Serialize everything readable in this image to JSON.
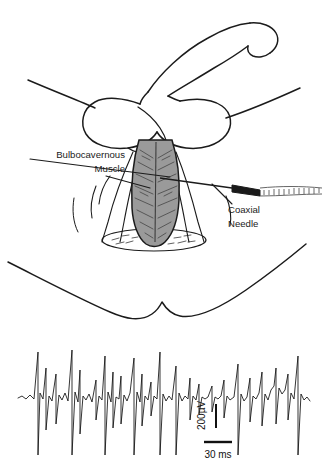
{
  "figure": {
    "title_alt": "Bulbocavernous muscle EMG recording with coaxial needle",
    "background_color": "#ffffff",
    "ink_color": "#1b1b1b",
    "muscle_fill_color": "#9a9a9a",
    "needle_hub_color": "#1a1a1a"
  },
  "anatomy": {
    "labels": [
      {
        "name": "bulbocavernous-muscle",
        "line1": "Bulbocavernous",
        "line2": "Muscle",
        "align": "right",
        "x": 125,
        "y1": 158,
        "y2": 172
      },
      {
        "name": "coaxial-needle",
        "line1": "Coaxial",
        "line2": "Needle",
        "align": "left",
        "x": 228,
        "y1": 213,
        "y2": 227
      }
    ]
  },
  "emg": {
    "scale_bars": {
      "vertical_label": "200µV",
      "horizontal_label": "30 ms"
    }
  },
  "chart_data": {
    "type": "line",
    "xlabel": "Time",
    "ylabel": "Amplitude",
    "x_scale_bar": {
      "label": "30 ms",
      "value": 30,
      "unit": "ms"
    },
    "y_scale_bar": {
      "label": "200µV",
      "value": 200,
      "unit": "µV"
    },
    "grid": false,
    "legend": "none",
    "baseline_y": 398,
    "series": [
      {
        "name": "bulbocavernous-emg",
        "description": "Continuous interference-pattern EMG with repeated high-amplitude motor unit potentials (sharp biphasic spikes) riding on a low-amplitude baseline.",
        "spike_times_px": [
          38,
          46,
          56,
          72,
          80,
          96,
          105,
          113,
          121,
          134,
          142,
          151,
          160,
          176,
          190,
          199,
          212,
          224,
          238,
          250,
          262,
          276,
          288,
          298
        ],
        "major_spike_times_px": [
          38,
          72,
          105,
          134,
          160,
          176,
          238,
          298
        ],
        "points": [
          [
            18,
            398
          ],
          [
            22,
            396
          ],
          [
            26,
            399
          ],
          [
            30,
            395
          ],
          [
            34,
            399
          ],
          [
            38,
            352
          ],
          [
            38,
            455
          ],
          [
            40,
            393
          ],
          [
            43,
            399
          ],
          [
            46,
            368
          ],
          [
            46,
            430
          ],
          [
            49,
            396
          ],
          [
            52,
            401
          ],
          [
            56,
            374
          ],
          [
            56,
            424
          ],
          [
            59,
            395
          ],
          [
            62,
            400
          ],
          [
            65,
            393
          ],
          [
            68,
            401
          ],
          [
            72,
            350
          ],
          [
            72,
            455
          ],
          [
            75,
            392
          ],
          [
            78,
            402
          ],
          [
            80,
            370
          ],
          [
            80,
            434
          ],
          [
            83,
            396
          ],
          [
            86,
            400
          ],
          [
            89,
            394
          ],
          [
            92,
            402
          ],
          [
            96,
            380
          ],
          [
            96,
            420
          ],
          [
            99,
            396
          ],
          [
            102,
            400
          ],
          [
            105,
            356
          ],
          [
            105,
            455
          ],
          [
            108,
            392
          ],
          [
            111,
            402
          ],
          [
            113,
            372
          ],
          [
            113,
            428
          ],
          [
            116,
            397
          ],
          [
            119,
            399
          ],
          [
            121,
            376
          ],
          [
            121,
            424
          ],
          [
            124,
            395
          ],
          [
            127,
            401
          ],
          [
            130,
            393
          ],
          [
            134,
            358
          ],
          [
            134,
            455
          ],
          [
            137,
            392
          ],
          [
            140,
            402
          ],
          [
            142,
            374
          ],
          [
            142,
            426
          ],
          [
            145,
            396
          ],
          [
            148,
            400
          ],
          [
            151,
            382
          ],
          [
            151,
            416
          ],
          [
            154,
            396
          ],
          [
            157,
            399
          ],
          [
            160,
            352
          ],
          [
            160,
            455
          ],
          [
            163,
            394
          ],
          [
            166,
            401
          ],
          [
            169,
            396
          ],
          [
            172,
            400
          ],
          [
            176,
            366
          ],
          [
            176,
            455
          ],
          [
            179,
            393
          ],
          [
            182,
            401
          ],
          [
            185,
            396
          ],
          [
            188,
            399
          ],
          [
            190,
            378
          ],
          [
            190,
            420
          ],
          [
            193,
            396
          ],
          [
            196,
            400
          ],
          [
            199,
            384
          ],
          [
            199,
            414
          ],
          [
            202,
            397
          ],
          [
            205,
            399
          ],
          [
            208,
            397
          ],
          [
            212,
            386
          ],
          [
            212,
            412
          ],
          [
            215,
            397
          ],
          [
            218,
            399
          ],
          [
            221,
            396
          ],
          [
            224,
            380
          ],
          [
            224,
            418
          ],
          [
            227,
            396
          ],
          [
            230,
            400
          ],
          [
            234,
            397
          ],
          [
            238,
            364
          ],
          [
            238,
            455
          ],
          [
            241,
            394
          ],
          [
            244,
            401
          ],
          [
            247,
            397
          ],
          [
            250,
            378
          ],
          [
            250,
            422
          ],
          [
            253,
            396
          ],
          [
            256,
            399
          ],
          [
            259,
            393
          ],
          [
            262,
            372
          ],
          [
            262,
            426
          ],
          [
            265,
            394
          ],
          [
            268,
            400
          ],
          [
            271,
            390
          ],
          [
            274,
            386
          ],
          [
            276,
            368
          ],
          [
            276,
            424
          ],
          [
            279,
            388
          ],
          [
            282,
            394
          ],
          [
            285,
            390
          ],
          [
            288,
            374
          ],
          [
            288,
            420
          ],
          [
            291,
            393
          ],
          [
            294,
            399
          ],
          [
            298,
            356
          ],
          [
            298,
            455
          ],
          [
            301,
            394
          ],
          [
            304,
            400
          ],
          [
            307,
            397
          ],
          [
            310,
            401
          ]
        ]
      }
    ]
  }
}
